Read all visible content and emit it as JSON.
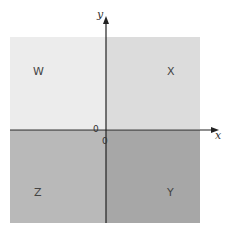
{
  "diagram": {
    "quadrants": [
      {
        "id": "W",
        "label": "W",
        "position": "top-left",
        "color": "#ececec"
      },
      {
        "id": "X",
        "label": "X",
        "position": "top-right",
        "color": "#dcdcdc"
      },
      {
        "id": "Z",
        "label": "Z",
        "position": "bottom-left",
        "color": "#b9b9b9"
      },
      {
        "id": "Y",
        "label": "Y",
        "position": "bottom-right",
        "color": "#a7a7a7"
      }
    ],
    "axes": {
      "x_label": "x",
      "y_label": "y",
      "origin_labels": [
        "0",
        "0"
      ]
    }
  }
}
